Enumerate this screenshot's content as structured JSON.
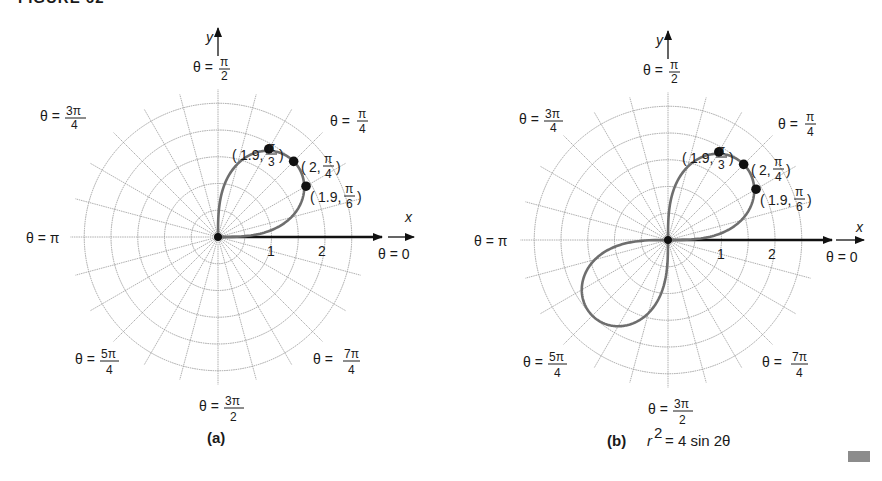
{
  "figure": {
    "heading": "FIGURE 62",
    "marker_color": "#8c8c8c"
  },
  "chart_data": [
    {
      "type": "polar",
      "panel": "(a)",
      "caption": "(a)",
      "equation": "",
      "radial_ticks": [
        1,
        2
      ],
      "radial_grid_step": 0.5,
      "radial_max": 2.5,
      "angular_grid_step_deg": 15,
      "axis_labels": {
        "x": "x",
        "y": "y"
      },
      "angle_labels": [
        "θ = 0",
        "θ = π/4",
        "θ = π/2",
        "θ = 3π/4",
        "θ = π",
        "θ = 5π/4",
        "θ = 3π/2",
        "θ = 7π/4"
      ],
      "curve": {
        "formula": "r = 2√(sin 2θ)",
        "theta_range": [
          0,
          "π/2"
        ]
      },
      "points": [
        {
          "r": 1.9,
          "theta": "π/3",
          "label": "(1.9, π/3)"
        },
        {
          "r": 2,
          "theta": "π/4",
          "label": "(2, π/4)"
        },
        {
          "r": 1.9,
          "theta": "π/6",
          "label": "(1.9, π/6)"
        }
      ]
    },
    {
      "type": "polar",
      "panel": "(b)",
      "caption": "(b)",
      "equation": "r² = 4 sin 2θ",
      "radial_ticks": [
        1,
        2
      ],
      "radial_grid_step": 0.5,
      "radial_max": 2.5,
      "angular_grid_step_deg": 15,
      "axis_labels": {
        "x": "x",
        "y": "y"
      },
      "angle_labels": [
        "θ = 0",
        "θ = π/4",
        "θ = π/2",
        "θ = 3π/4",
        "θ = π",
        "θ = 5π/4",
        "θ = 3π/2",
        "θ = 7π/4"
      ],
      "curve": {
        "formula": "r² = 4 sin 2θ (lemniscate)",
        "theta_range": [
          0,
          "π/2"
        ],
        "petals": [
          "first quadrant",
          "third quadrant"
        ]
      },
      "points": [
        {
          "r": 1.9,
          "theta": "π/3",
          "label": "(1.9, π/3)"
        },
        {
          "r": 2,
          "theta": "π/4",
          "label": "(2, π/4)"
        },
        {
          "r": 1.9,
          "theta": "π/6",
          "label": "(1.9, π/6)"
        }
      ]
    }
  ],
  "labels": {
    "theta": "θ =",
    "pi": "π",
    "two": "2",
    "four": "4",
    "three_pi": "3π",
    "five_pi": "5π",
    "seven_pi": "7π",
    "zero": "θ = 0",
    "theta_pi": "θ = π",
    "x": "x",
    "y": "y",
    "tick1": "1",
    "tick2": "2",
    "pt_a1": "1.9,",
    "pt_a2": "2,",
    "pt_a3": "1.9,",
    "pi_over": "π",
    "three": "3",
    "six": "6",
    "cap_a": "(a)",
    "cap_b": "(b)",
    "eq_r": "r",
    "eq_sup": "2",
    "eq_rest": "= 4 sin 2θ"
  }
}
